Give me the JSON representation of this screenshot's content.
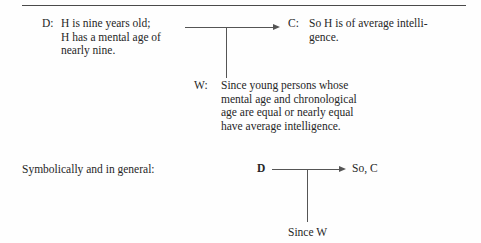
{
  "figure": {
    "type": "toulmin-argument-diagram",
    "top_rule": true,
    "ink_color": "#2b2b2b",
    "line_color": "#555555",
    "background": "#fefefe"
  },
  "top_argument": {
    "data": {
      "tag": "D:",
      "lines": [
        "H is nine years old;",
        "H has a mental age of",
        "nearly nine."
      ],
      "text": "H is nine years old;\nH has a mental age of\nnearly nine."
    },
    "claim": {
      "tag": "C:",
      "lines": [
        "So H is of average intelli-",
        "gence."
      ],
      "text": "So H is of average intelli-\ngence."
    },
    "warrant": {
      "tag": "W:",
      "lines": [
        "Since young persons whose",
        "mental age and chronological",
        "age are equal or nearly equal",
        "have average intelligence."
      ],
      "text": "Since young persons whose\nmental age and chronological\nage are equal or nearly equal\nhave average intelligence."
    },
    "arrow": {
      "name": "data-to-claim-arrow",
      "direction": "right",
      "has_warrant_stem": true
    }
  },
  "symbolic_form": {
    "label": "Symbolically and in general:",
    "data_symbol": "D",
    "claim_symbol": "So, C",
    "warrant_symbol": "Since W",
    "arrow": {
      "name": "symbolic-data-to-claim-arrow",
      "direction": "right",
      "has_warrant_stem": true
    }
  }
}
